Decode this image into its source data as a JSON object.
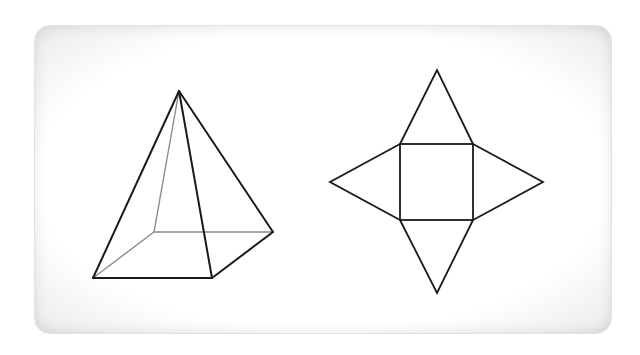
{
  "diagram": {
    "title": "",
    "colors": {
      "edge_visible": "#1a1a1a",
      "edge_hidden": "#8a8a8a",
      "card_background": "#ffffff",
      "card_border": "#e2e2e2"
    },
    "pyramid": {
      "label": "square-pyramid",
      "apex": [
        179,
        91
      ],
      "base_front_left": [
        93,
        278
      ],
      "base_front_right": [
        212,
        278
      ],
      "base_back_right": [
        273,
        232
      ],
      "base_back_left_hidden": [
        154,
        232
      ]
    },
    "net": {
      "label": "pyramid-net",
      "square": {
        "x": 400,
        "y": 144,
        "width": 73,
        "height": 76
      },
      "triangle_tips": {
        "top": [
          437,
          70
        ],
        "bottom": [
          437,
          293
        ],
        "left": [
          330,
          182
        ],
        "right": [
          543,
          182
        ]
      }
    }
  }
}
